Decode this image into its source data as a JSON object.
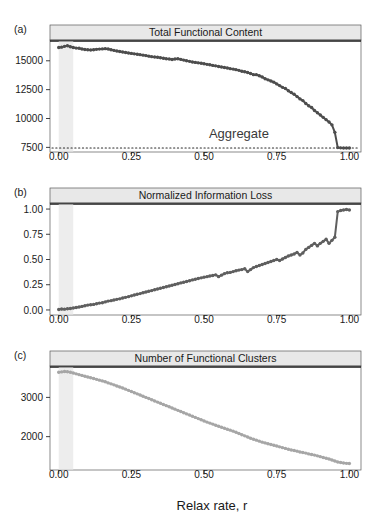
{
  "figure": {
    "xlabel": "Relax rate, r",
    "background": "#ffffff",
    "strip_fill": "#e8e8e8",
    "strip_border": "#1a1a1a",
    "panel_border": "#5a5a5a",
    "highlight_band": {
      "fill": "#ededed",
      "x_start": 0.0,
      "x_end": 0.05
    }
  },
  "panels": [
    {
      "letter": "(a)",
      "title": "Total Functional Content",
      "color": "#4d4d4d",
      "y_ticks": [
        "15000",
        "12500",
        "10000",
        "7500"
      ],
      "x_ticks": [
        "0.00",
        "0.25",
        "0.50",
        "0.75",
        "1.00"
      ],
      "annotation": "Aggregate"
    },
    {
      "letter": "(b)",
      "title": "Normalized Information Loss",
      "color": "#5f5f5f",
      "y_ticks": [
        "1.00",
        "0.75",
        "0.50",
        "0.25",
        "0.00"
      ],
      "x_ticks": [
        "0.00",
        "0.25",
        "0.50",
        "0.75",
        "1.00"
      ],
      "annotation": ""
    },
    {
      "letter": "(c)",
      "title": "Number of Functional Clusters",
      "color": "#a6a6a6",
      "y_ticks": [
        "3000",
        "2000"
      ],
      "x_ticks": [
        "0.00",
        "0.25",
        "0.50",
        "0.75",
        "1.00"
      ],
      "annotation": ""
    }
  ],
  "chart_data": [
    {
      "type": "scatter",
      "panel": "a",
      "title": "Total Functional Content",
      "xlabel": "Relax rate, r",
      "ylabel": "",
      "xlim": [
        -0.03,
        1.04
      ],
      "ylim": [
        7100,
        16800
      ],
      "yticks": [
        15000,
        12500,
        10000,
        7500
      ],
      "xticks": [
        0.0,
        0.25,
        0.5,
        0.75,
        1.0
      ],
      "grid": false,
      "legend": null,
      "annotations": [
        {
          "text": "Aggregate",
          "x": 0.62,
          "y": 8300
        }
      ],
      "hlines": [
        {
          "y": 7450,
          "style": "dotted",
          "label": "Aggregate"
        }
      ],
      "x": [
        0.0,
        0.01,
        0.02,
        0.03,
        0.04,
        0.05,
        0.06,
        0.07,
        0.08,
        0.09,
        0.1,
        0.11,
        0.12,
        0.13,
        0.14,
        0.15,
        0.16,
        0.17,
        0.18,
        0.19,
        0.2,
        0.21,
        0.22,
        0.23,
        0.24,
        0.25,
        0.26,
        0.27,
        0.28,
        0.29,
        0.3,
        0.31,
        0.32,
        0.33,
        0.34,
        0.35,
        0.36,
        0.37,
        0.38,
        0.39,
        0.4,
        0.41,
        0.42,
        0.43,
        0.44,
        0.45,
        0.46,
        0.47,
        0.48,
        0.49,
        0.5,
        0.51,
        0.52,
        0.53,
        0.54,
        0.55,
        0.56,
        0.57,
        0.58,
        0.59,
        0.6,
        0.61,
        0.62,
        0.63,
        0.64,
        0.65,
        0.66,
        0.67,
        0.68,
        0.69,
        0.7,
        0.71,
        0.72,
        0.73,
        0.74,
        0.75,
        0.76,
        0.77,
        0.78,
        0.79,
        0.8,
        0.81,
        0.82,
        0.83,
        0.84,
        0.85,
        0.86,
        0.87,
        0.88,
        0.89,
        0.9,
        0.91,
        0.92,
        0.93,
        0.94,
        0.95,
        0.96,
        0.97,
        0.98,
        0.99,
        1.0
      ],
      "y": [
        16150,
        16180,
        16250,
        16300,
        16220,
        16150,
        16100,
        16080,
        16020,
        15980,
        15950,
        15930,
        15960,
        15990,
        16010,
        16030,
        16050,
        16020,
        15960,
        15900,
        15850,
        15800,
        15760,
        15720,
        15680,
        15640,
        15600,
        15570,
        15530,
        15490,
        15450,
        15400,
        15360,
        15330,
        15300,
        15260,
        15220,
        15180,
        15150,
        15110,
        15150,
        15180,
        15120,
        15060,
        15000,
        14950,
        14900,
        14860,
        14820,
        14780,
        14740,
        14690,
        14650,
        14600,
        14560,
        14510,
        14460,
        14420,
        14380,
        14320,
        14280,
        14230,
        14170,
        14100,
        14050,
        13980,
        13900,
        13800,
        13800,
        13700,
        13600,
        13450,
        13350,
        13250,
        13150,
        13000,
        12850,
        12700,
        12600,
        12400,
        12250,
        12100,
        11900,
        11700,
        11550,
        11300,
        11100,
        10950,
        10700,
        10500,
        10300,
        10100,
        9900,
        9700,
        9450,
        8800,
        7480,
        7460,
        7450,
        7450,
        7440
      ]
    },
    {
      "type": "scatter",
      "panel": "b",
      "title": "Normalized Information Loss",
      "xlabel": "Relax rate, r",
      "ylabel": "",
      "xlim": [
        -0.03,
        1.04
      ],
      "ylim": [
        -0.05,
        1.06
      ],
      "yticks": [
        1.0,
        0.75,
        0.5,
        0.25,
        0.0
      ],
      "xticks": [
        0.0,
        0.25,
        0.5,
        0.75,
        1.0
      ],
      "grid": false,
      "legend": null,
      "annotations": [],
      "x": [
        0.0,
        0.01,
        0.02,
        0.03,
        0.04,
        0.05,
        0.06,
        0.07,
        0.08,
        0.09,
        0.1,
        0.11,
        0.12,
        0.13,
        0.14,
        0.15,
        0.16,
        0.17,
        0.18,
        0.19,
        0.2,
        0.21,
        0.22,
        0.23,
        0.24,
        0.25,
        0.26,
        0.27,
        0.28,
        0.29,
        0.3,
        0.31,
        0.32,
        0.33,
        0.34,
        0.35,
        0.36,
        0.37,
        0.38,
        0.39,
        0.4,
        0.41,
        0.42,
        0.43,
        0.44,
        0.45,
        0.46,
        0.47,
        0.48,
        0.49,
        0.5,
        0.51,
        0.52,
        0.53,
        0.54,
        0.55,
        0.56,
        0.57,
        0.58,
        0.59,
        0.6,
        0.61,
        0.62,
        0.63,
        0.64,
        0.65,
        0.66,
        0.67,
        0.68,
        0.69,
        0.7,
        0.71,
        0.72,
        0.73,
        0.74,
        0.75,
        0.76,
        0.77,
        0.78,
        0.79,
        0.8,
        0.81,
        0.82,
        0.83,
        0.84,
        0.85,
        0.86,
        0.87,
        0.88,
        0.89,
        0.9,
        0.91,
        0.92,
        0.93,
        0.94,
        0.95,
        0.96,
        0.97,
        0.98,
        0.99,
        1.0
      ],
      "y": [
        0.005,
        0.01,
        0.008,
        0.012,
        0.015,
        0.02,
        0.025,
        0.03,
        0.035,
        0.042,
        0.048,
        0.052,
        0.055,
        0.062,
        0.068,
        0.072,
        0.08,
        0.088,
        0.092,
        0.098,
        0.105,
        0.11,
        0.118,
        0.125,
        0.132,
        0.14,
        0.148,
        0.155,
        0.162,
        0.17,
        0.178,
        0.185,
        0.192,
        0.2,
        0.208,
        0.215,
        0.222,
        0.23,
        0.238,
        0.245,
        0.252,
        0.26,
        0.268,
        0.275,
        0.282,
        0.29,
        0.298,
        0.305,
        0.312,
        0.318,
        0.325,
        0.33,
        0.336,
        0.342,
        0.348,
        0.33,
        0.345,
        0.36,
        0.368,
        0.372,
        0.38,
        0.388,
        0.395,
        0.4,
        0.408,
        0.38,
        0.4,
        0.42,
        0.43,
        0.44,
        0.45,
        0.46,
        0.47,
        0.48,
        0.49,
        0.5,
        0.49,
        0.505,
        0.52,
        0.535,
        0.545,
        0.555,
        0.57,
        0.545,
        0.565,
        0.6,
        0.62,
        0.64,
        0.66,
        0.635,
        0.66,
        0.68,
        0.7,
        0.66,
        0.69,
        0.72,
        0.975,
        0.985,
        0.99,
        0.995,
        0.99
      ]
    },
    {
      "type": "scatter",
      "panel": "c",
      "title": "Number of Functional Clusters",
      "xlabel": "Relax rate, r",
      "ylabel": "",
      "xlim": [
        -0.03,
        1.04
      ],
      "ylim": [
        1150,
        3800
      ],
      "yticks": [
        3000,
        2000
      ],
      "xticks": [
        0.0,
        0.25,
        0.5,
        0.75,
        1.0
      ],
      "grid": false,
      "legend": null,
      "annotations": [],
      "x": [
        0.0,
        0.01,
        0.02,
        0.03,
        0.04,
        0.05,
        0.06,
        0.07,
        0.08,
        0.09,
        0.1,
        0.11,
        0.12,
        0.13,
        0.14,
        0.15,
        0.16,
        0.17,
        0.18,
        0.19,
        0.2,
        0.21,
        0.22,
        0.23,
        0.24,
        0.25,
        0.26,
        0.27,
        0.28,
        0.29,
        0.3,
        0.31,
        0.32,
        0.33,
        0.34,
        0.35,
        0.36,
        0.37,
        0.38,
        0.39,
        0.4,
        0.41,
        0.42,
        0.43,
        0.44,
        0.45,
        0.46,
        0.47,
        0.48,
        0.49,
        0.5,
        0.51,
        0.52,
        0.53,
        0.54,
        0.55,
        0.56,
        0.57,
        0.58,
        0.59,
        0.6,
        0.61,
        0.62,
        0.63,
        0.64,
        0.65,
        0.66,
        0.67,
        0.68,
        0.69,
        0.7,
        0.71,
        0.72,
        0.73,
        0.74,
        0.75,
        0.76,
        0.77,
        0.78,
        0.79,
        0.8,
        0.81,
        0.82,
        0.83,
        0.84,
        0.85,
        0.86,
        0.87,
        0.88,
        0.89,
        0.9,
        0.91,
        0.92,
        0.93,
        0.94,
        0.95,
        0.96,
        0.97,
        0.98,
        0.99,
        1.0
      ],
      "y": [
        3640,
        3650,
        3660,
        3655,
        3640,
        3620,
        3600,
        3580,
        3560,
        3540,
        3520,
        3500,
        3480,
        3460,
        3440,
        3420,
        3400,
        3370,
        3345,
        3320,
        3290,
        3265,
        3240,
        3210,
        3180,
        3150,
        3120,
        3090,
        3060,
        3030,
        3000,
        2970,
        2940,
        2910,
        2880,
        2850,
        2820,
        2790,
        2760,
        2730,
        2700,
        2670,
        2640,
        2610,
        2580,
        2550,
        2520,
        2490,
        2460,
        2430,
        2400,
        2370,
        2345,
        2320,
        2290,
        2265,
        2240,
        2215,
        2190,
        2165,
        2140,
        2110,
        2080,
        2050,
        2020,
        1990,
        1960,
        1935,
        1910,
        1885,
        1860,
        1840,
        1820,
        1800,
        1780,
        1760,
        1740,
        1720,
        1700,
        1680,
        1660,
        1645,
        1630,
        1610,
        1595,
        1580,
        1560,
        1545,
        1530,
        1510,
        1490,
        1470,
        1450,
        1430,
        1405,
        1380,
        1355,
        1340,
        1330,
        1320,
        1315
      ]
    }
  ]
}
